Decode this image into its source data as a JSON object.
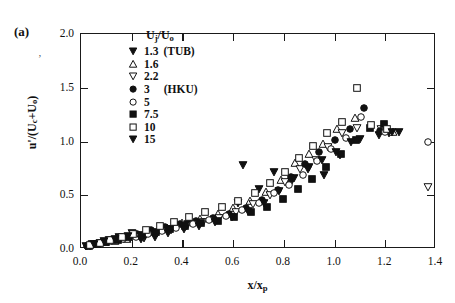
{
  "figure": {
    "panel_label": "(a)",
    "stray_mark": "‚"
  },
  "legend": {
    "title_html": "U<sub>j</sub>/U<sub>o</sub>",
    "title_plain": "Uj/Uo",
    "entries": [
      {
        "marker": "filled-down-triangle",
        "label": "1.3",
        "note": "(TUB)"
      },
      {
        "marker": "open-up-triangle",
        "label": "1.6",
        "note": ""
      },
      {
        "marker": "open-down-triangle",
        "label": "2.2",
        "note": ""
      },
      {
        "marker": "filled-circle",
        "label": "3",
        "note": "(HKU)"
      },
      {
        "marker": "open-circle",
        "label": "5",
        "note": ""
      },
      {
        "marker": "filled-square",
        "label": "7.5",
        "note": ""
      },
      {
        "marker": "open-square",
        "label": "10",
        "note": ""
      },
      {
        "marker": "filled-down-triangle",
        "label": "15",
        "note": ""
      }
    ]
  },
  "chart_data": {
    "type": "scatter",
    "title": "",
    "xlabel": "x/xp",
    "xlabel_html": "x/x<sub>p</sub>",
    "ylabel": "u'/(Uc+Uo)",
    "ylabel_html": "u'/(U<sub>c</sub>+U<sub>o</sub>)",
    "xlim": [
      0.0,
      1.4
    ],
    "ylim": [
      0.0,
      2.0
    ],
    "xticks": [
      "0.0",
      "0.2",
      "0.4",
      "0.6",
      "0.8",
      "1.0",
      "1.2",
      "1.4"
    ],
    "xtick_values": [
      0.0,
      0.2,
      0.4,
      0.6,
      0.8,
      1.0,
      1.2,
      1.4
    ],
    "yticks": [
      "0.0",
      "0.5",
      "1.0",
      "1.5",
      "2.0"
    ],
    "ytick_values": [
      0.0,
      0.5,
      1.0,
      1.5,
      2.0
    ],
    "grid": false,
    "legend_position": "upper-left-inside",
    "series": [
      {
        "name": "1.3 (TUB)",
        "marker": "filled-down-triangle",
        "points": [
          [
            0.02,
            0.03
          ],
          [
            0.045,
            0.042
          ],
          [
            0.075,
            0.06
          ],
          [
            0.11,
            0.085
          ],
          [
            0.15,
            0.115
          ],
          [
            0.2,
            0.15
          ],
          [
            0.25,
            0.105
          ],
          [
            0.3,
            0.15
          ],
          [
            0.35,
            0.185
          ],
          [
            0.42,
            0.23
          ],
          [
            0.48,
            0.255
          ],
          [
            0.545,
            0.29
          ],
          [
            0.62,
            0.43
          ],
          [
            0.7,
            0.56
          ],
          [
            0.76,
            0.72
          ],
          [
            0.83,
            0.62
          ],
          [
            0.9,
            0.76
          ],
          [
            0.96,
            0.69
          ],
          [
            1.02,
            0.87
          ],
          [
            1.1,
            1.02
          ],
          [
            1.175,
            1.06
          ],
          [
            1.215,
            1.08
          ]
        ]
      },
      {
        "name": "1.6",
        "marker": "open-up-triangle",
        "points": [
          [
            0.03,
            0.035
          ],
          [
            0.06,
            0.048
          ],
          [
            0.095,
            0.062
          ],
          [
            0.135,
            0.078
          ],
          [
            0.18,
            0.095
          ],
          [
            0.225,
            0.12
          ],
          [
            0.285,
            0.16
          ],
          [
            0.34,
            0.195
          ],
          [
            0.4,
            0.245
          ],
          [
            0.47,
            0.28
          ],
          [
            0.54,
            0.33
          ],
          [
            0.6,
            0.38
          ],
          [
            0.665,
            0.45
          ],
          [
            0.73,
            0.53
          ],
          [
            0.79,
            0.64
          ],
          [
            0.845,
            0.8
          ],
          [
            0.9,
            0.88
          ],
          [
            0.955,
            0.98
          ],
          [
            1.01,
            1.12
          ],
          [
            1.08,
            1.215
          ],
          [
            1.19,
            1.105
          ],
          [
            1.23,
            1.09
          ]
        ]
      },
      {
        "name": "2.2",
        "marker": "open-down-triangle",
        "points": [
          [
            0.035,
            0.032
          ],
          [
            0.07,
            0.05
          ],
          [
            0.105,
            0.068
          ],
          [
            0.15,
            0.09
          ],
          [
            0.195,
            0.1
          ],
          [
            0.25,
            0.12
          ],
          [
            0.3,
            0.15
          ],
          [
            0.355,
            0.18
          ],
          [
            0.415,
            0.215
          ],
          [
            0.48,
            0.25
          ],
          [
            0.545,
            0.29
          ],
          [
            0.61,
            0.345
          ],
          [
            0.68,
            0.42
          ],
          [
            0.745,
            0.5
          ],
          [
            0.805,
            0.62
          ],
          [
            0.865,
            0.74
          ],
          [
            0.925,
            0.83
          ],
          [
            0.975,
            0.95
          ],
          [
            1.03,
            1.08
          ],
          [
            1.09,
            1.13
          ],
          [
            1.185,
            1.12
          ],
          [
            1.37,
            0.58
          ]
        ]
      },
      {
        "name": "3 (HKU)",
        "marker": "filled-circle",
        "points": [
          [
            0.025,
            0.028
          ],
          [
            0.055,
            0.045
          ],
          [
            0.09,
            0.065
          ],
          [
            0.13,
            0.085
          ],
          [
            0.175,
            0.11
          ],
          [
            0.22,
            0.14
          ],
          [
            0.275,
            0.175
          ],
          [
            0.33,
            0.205
          ],
          [
            0.39,
            0.235
          ],
          [
            0.455,
            0.26
          ],
          [
            0.52,
            0.29
          ],
          [
            0.585,
            0.33
          ],
          [
            0.65,
            0.38
          ],
          [
            0.715,
            0.455
          ],
          [
            0.775,
            0.545
          ],
          [
            0.83,
            0.67
          ],
          [
            0.885,
            0.79
          ],
          [
            0.94,
            0.9
          ],
          [
            1.0,
            1.01
          ],
          [
            1.06,
            1.12
          ],
          [
            1.115,
            1.31
          ],
          [
            1.18,
            1.095
          ]
        ]
      },
      {
        "name": "5",
        "marker": "open-circle",
        "points": [
          [
            0.04,
            0.038
          ],
          [
            0.08,
            0.055
          ],
          [
            0.12,
            0.075
          ],
          [
            0.165,
            0.095
          ],
          [
            0.215,
            0.112
          ],
          [
            0.265,
            0.135
          ],
          [
            0.32,
            0.165
          ],
          [
            0.375,
            0.2
          ],
          [
            0.44,
            0.235
          ],
          [
            0.505,
            0.27
          ],
          [
            0.57,
            0.31
          ],
          [
            0.635,
            0.36
          ],
          [
            0.7,
            0.43
          ],
          [
            0.76,
            0.52
          ],
          [
            0.82,
            0.6
          ],
          [
            0.875,
            0.69
          ],
          [
            0.93,
            0.82
          ],
          [
            0.985,
            0.93
          ],
          [
            1.045,
            1.035
          ],
          [
            1.105,
            1.23
          ],
          [
            1.2,
            1.09
          ],
          [
            1.37,
            1.0
          ]
        ]
      },
      {
        "name": "7.5",
        "marker": "filled-square",
        "points": [
          [
            0.03,
            0.03
          ],
          [
            0.065,
            0.048
          ],
          [
            0.1,
            0.068
          ],
          [
            0.145,
            0.088
          ],
          [
            0.19,
            0.108
          ],
          [
            0.24,
            0.13
          ],
          [
            0.295,
            0.16
          ],
          [
            0.35,
            0.19
          ],
          [
            0.41,
            0.218
          ],
          [
            0.475,
            0.24
          ],
          [
            0.54,
            0.265
          ],
          [
            0.605,
            0.3
          ],
          [
            0.67,
            0.34
          ],
          [
            0.735,
            0.395
          ],
          [
            0.795,
            0.465
          ],
          [
            0.855,
            0.56
          ],
          [
            0.91,
            0.65
          ],
          [
            0.965,
            0.76
          ],
          [
            1.025,
            0.88
          ],
          [
            1.085,
            1.01
          ],
          [
            1.14,
            1.13
          ],
          [
            1.195,
            1.16
          ]
        ]
      },
      {
        "name": "10",
        "marker": "open-square",
        "points": [
          [
            0.035,
            0.04
          ],
          [
            0.075,
            0.06
          ],
          [
            0.115,
            0.085
          ],
          [
            0.16,
            0.112
          ],
          [
            0.205,
            0.14
          ],
          [
            0.255,
            0.175
          ],
          [
            0.31,
            0.215
          ],
          [
            0.365,
            0.255
          ],
          [
            0.425,
            0.3
          ],
          [
            0.49,
            0.345
          ],
          [
            0.555,
            0.395
          ],
          [
            0.62,
            0.45
          ],
          [
            0.685,
            0.52
          ],
          [
            0.745,
            0.615
          ],
          [
            0.805,
            0.72
          ],
          [
            0.86,
            0.85
          ],
          [
            0.915,
            0.96
          ],
          [
            0.97,
            1.08
          ],
          [
            1.03,
            1.18
          ],
          [
            1.09,
            1.5
          ],
          [
            1.145,
            1.15
          ],
          [
            1.205,
            1.12
          ]
        ]
      },
      {
        "name": "15",
        "marker": "filled-down-triangle",
        "points": [
          [
            0.05,
            0.045
          ],
          [
            0.09,
            0.07
          ],
          [
            0.135,
            0.095
          ],
          [
            0.185,
            0.118
          ],
          [
            0.235,
            0.09
          ],
          [
            0.29,
            0.115
          ],
          [
            0.345,
            0.145
          ],
          [
            0.405,
            0.185
          ],
          [
            0.465,
            0.215
          ],
          [
            0.53,
            0.25
          ],
          [
            0.595,
            0.295
          ],
          [
            0.66,
            0.355
          ],
          [
            0.72,
            0.43
          ],
          [
            0.78,
            0.54
          ],
          [
            0.84,
            0.66
          ],
          [
            0.895,
            0.74
          ],
          [
            0.95,
            0.83
          ],
          [
            1.005,
            0.905
          ],
          [
            1.065,
            1.0
          ],
          [
            1.225,
            1.09
          ],
          [
            1.255,
            1.085
          ],
          [
            0.64,
            0.78
          ]
        ]
      }
    ]
  }
}
